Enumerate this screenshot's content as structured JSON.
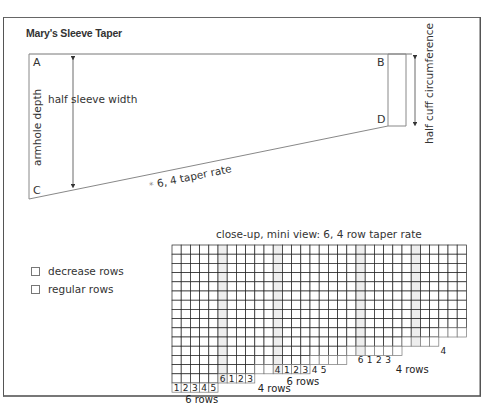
{
  "title": "Mary's Sleeve Taper",
  "diagram": {
    "corners": {
      "a": "A",
      "b": "B",
      "c": "C",
      "d": "D"
    },
    "labels": {
      "armhole_depth": "armhole depth",
      "half_sleeve_width": "half sleeve width",
      "half_cuff_circumference": "half cuff circumference",
      "taper_rate": "6, 4 taper rate",
      "taper_marker": "*"
    }
  },
  "legend": {
    "items": [
      {
        "label": "decrease rows"
      },
      {
        "label": "regular rows"
      }
    ]
  },
  "closeup": {
    "title": "close-up, mini view:  6, 4 row taper rate",
    "groups": [
      {
        "numbers": [
          "1",
          "2",
          "3",
          "4",
          "5"
        ],
        "label": "6 rows"
      },
      {
        "numbers": [
          "6",
          "1",
          "2",
          "3"
        ],
        "label": "4 rows"
      },
      {
        "numbers": [
          "4",
          "1",
          "2",
          "3",
          "4",
          "5"
        ],
        "label": "6 rows"
      },
      {
        "numbers": [
          "6",
          "1",
          "2",
          "3"
        ],
        "label": "4 rows"
      },
      {
        "numbers": [
          "4"
        ],
        "label": ""
      }
    ]
  }
}
